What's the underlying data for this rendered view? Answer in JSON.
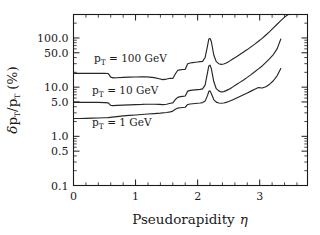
{
  "chart_data": {
    "type": "line",
    "title": "",
    "xlabel": "Pseudorapidity η",
    "ylabel": "δp_T/p_T (%)",
    "yscale": "log",
    "xlim": [
      0,
      3.77
    ],
    "ylim": [
      0.1,
      300
    ],
    "grid": false,
    "legend_position": "inline-annotations",
    "xticks": [
      0,
      1,
      2,
      3
    ],
    "xticklabels": [
      "0",
      "1",
      "2",
      "3"
    ],
    "yticks": [
      0.1,
      0.5,
      1.0,
      5.0,
      10.0,
      50.0,
      100.0
    ],
    "yticklabels": [
      "0.1",
      "0.5",
      "1.0",
      "5.0",
      "10.0",
      "50.0",
      "100.0"
    ],
    "series": [
      {
        "name": "p_T = 100 GeV",
        "label": "p",
        "label_sub": "T",
        "label_rest": " = 100  GeV",
        "label_x": 0.33,
        "label_y": 32.0,
        "x": [
          0.0,
          0.1,
          0.2,
          0.3,
          0.4,
          0.5,
          0.56,
          0.6,
          0.64,
          0.7,
          0.8,
          0.9,
          1.0,
          1.1,
          1.16,
          1.22,
          1.3,
          1.38,
          1.44,
          1.5,
          1.56,
          1.6,
          1.64,
          1.68,
          1.72,
          1.76,
          1.8,
          1.84,
          1.88,
          1.92,
          1.96,
          2.0,
          2.04,
          2.08,
          2.12,
          2.16,
          2.18,
          2.2,
          2.22,
          2.26,
          2.3,
          2.34,
          2.38,
          2.42,
          2.46,
          2.5,
          2.56,
          2.62,
          2.68,
          2.74,
          2.8,
          2.86,
          2.92,
          2.98,
          3.04,
          3.1,
          3.16,
          3.22,
          3.28,
          3.34,
          3.4,
          3.46
        ],
        "y": [
          19.0,
          19.0,
          19.0,
          19.0,
          19.0,
          19.0,
          18.9,
          16.0,
          15.4,
          15.5,
          15.8,
          16.0,
          16.1,
          16.2,
          16.3,
          16.0,
          15.6,
          14.8,
          14.2,
          14.6,
          15.2,
          15.0,
          18.5,
          22.0,
          22.5,
          22.8,
          23.0,
          30.0,
          31.0,
          31.5,
          32.0,
          32.5,
          33.0,
          33.5,
          40.0,
          70.0,
          95.0,
          98.0,
          85.0,
          45.0,
          33.0,
          30.0,
          29.0,
          29.5,
          31.0,
          33.0,
          37.0,
          41.0,
          46.0,
          52.0,
          58.0,
          66.0,
          75.0,
          86.0,
          98.0,
          115.0,
          135.0,
          160.0,
          190.0,
          225.0,
          265.0,
          300.0
        ]
      },
      {
        "name": "p_T = 10 GeV",
        "label": "p",
        "label_sub": "T",
        "label_rest": " = 10  GeV",
        "label_x": 0.3,
        "label_y": 7.4,
        "x": [
          0.0,
          0.1,
          0.2,
          0.3,
          0.4,
          0.5,
          0.56,
          0.6,
          0.64,
          0.7,
          0.8,
          0.9,
          1.0,
          1.1,
          1.16,
          1.22,
          1.3,
          1.38,
          1.44,
          1.5,
          1.56,
          1.6,
          1.64,
          1.68,
          1.72,
          1.76,
          1.8,
          1.84,
          1.88,
          1.92,
          1.96,
          2.0,
          2.04,
          2.08,
          2.12,
          2.16,
          2.18,
          2.2,
          2.22,
          2.26,
          2.3,
          2.34,
          2.38,
          2.42,
          2.46,
          2.5,
          2.56,
          2.62,
          2.68,
          2.74,
          2.8,
          2.86,
          2.92,
          2.98,
          3.04,
          3.1,
          3.16,
          3.22,
          3.28,
          3.34
        ],
        "y": [
          4.9,
          4.9,
          4.9,
          4.9,
          4.9,
          4.85,
          4.8,
          4.25,
          4.2,
          4.25,
          4.3,
          4.35,
          4.4,
          4.45,
          4.5,
          4.5,
          4.5,
          4.45,
          4.4,
          4.5,
          4.7,
          4.8,
          5.6,
          6.2,
          6.4,
          6.5,
          6.6,
          8.3,
          8.6,
          8.7,
          8.8,
          8.9,
          9.0,
          9.2,
          11.0,
          20.0,
          27.0,
          28.0,
          24.0,
          13.0,
          9.3,
          8.4,
          8.0,
          8.1,
          8.5,
          9.0,
          10.0,
          11.2,
          12.5,
          14.0,
          15.8,
          18.0,
          20.5,
          23.5,
          27.0,
          32.0,
          38.0,
          46.0,
          60.0,
          95.0
        ]
      },
      {
        "name": "p_T = 1 GeV",
        "label": "p",
        "label_sub": "T",
        "label_rest": " = 1  GeV",
        "label_x": 0.3,
        "label_y": 1.62,
        "x": [
          0.0,
          0.1,
          0.2,
          0.3,
          0.4,
          0.5,
          0.56,
          0.62,
          0.7,
          0.8,
          0.9,
          1.0,
          1.1,
          1.2,
          1.3,
          1.4,
          1.5,
          1.56,
          1.6,
          1.64,
          1.68,
          1.72,
          1.76,
          1.8,
          1.84,
          1.88,
          1.92,
          1.96,
          2.0,
          2.04,
          2.08,
          2.12,
          2.16,
          2.18,
          2.2,
          2.22,
          2.26,
          2.3,
          2.34,
          2.38,
          2.42,
          2.46,
          2.5,
          2.56,
          2.62,
          2.68,
          2.74,
          2.8,
          2.86,
          2.92,
          2.98,
          3.04,
          3.1,
          3.16,
          3.22,
          3.28,
          3.34
        ],
        "y": [
          2.3,
          2.3,
          2.32,
          2.34,
          2.36,
          2.38,
          2.4,
          2.45,
          2.52,
          2.6,
          2.66,
          2.72,
          2.78,
          2.84,
          2.9,
          2.96,
          3.05,
          3.15,
          3.25,
          3.55,
          3.75,
          3.82,
          3.86,
          3.9,
          4.45,
          4.55,
          4.6,
          4.65,
          4.7,
          4.75,
          4.85,
          5.2,
          6.8,
          8.2,
          8.4,
          7.4,
          5.6,
          4.95,
          4.75,
          4.7,
          4.75,
          4.9,
          5.1,
          5.5,
          5.95,
          6.45,
          7.0,
          7.6,
          8.3,
          9.1,
          9.8,
          9.6,
          10.2,
          11.5,
          13.5,
          17.0,
          24.0
        ]
      }
    ]
  },
  "axis": {
    "x_title_main": "Pseudorapidity",
    "x_title_symbol": "η",
    "y_title_delta": "δ",
    "y_title_p1": "p",
    "y_title_sub1": "T",
    "y_title_slash": "/p",
    "y_title_sub2": "T",
    "y_title_unit": "(%)"
  }
}
